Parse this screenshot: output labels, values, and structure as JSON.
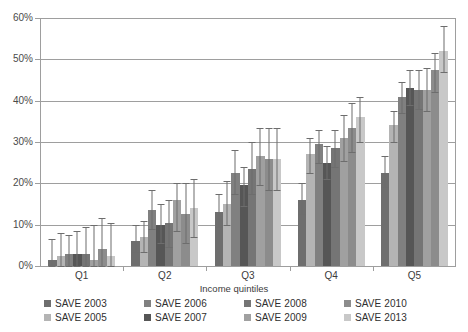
{
  "chart_data": {
    "type": "bar",
    "title": "",
    "subtitle": "",
    "xlabel": "Income quintiles",
    "ylabel": "",
    "categories": [
      "Q1",
      "Q2",
      "Q3",
      "Q4",
      "Q5"
    ],
    "ylim": [
      0,
      60
    ],
    "ytick_labels": [
      "0%",
      "10%",
      "20%",
      "30%",
      "40%",
      "50%",
      "60%"
    ],
    "ytick_values": [
      0,
      10,
      20,
      30,
      40,
      50,
      60
    ],
    "grid": true,
    "legend_position": "bottom",
    "value_unit": "percent",
    "error_bars": true,
    "series": [
      {
        "name": "SAVE 2003",
        "color": "#6e6e6e",
        "values": [
          1.5,
          6.0,
          13.0,
          16.0,
          22.5
        ],
        "err_low": [
          1.5,
          2.5,
          3.5,
          3.5,
          3.5
        ],
        "err_high": [
          5.0,
          4.0,
          4.5,
          4.0,
          4.0
        ]
      },
      {
        "name": "SAVE 2005",
        "color": "#b4b4b4",
        "values": [
          2.5,
          7.0,
          15.0,
          27.0,
          34.0
        ],
        "err_low": [
          2.5,
          3.5,
          5.0,
          4.5,
          4.0
        ],
        "err_high": [
          5.5,
          4.0,
          5.5,
          4.0,
          3.5
        ]
      },
      {
        "name": "SAVE 2006",
        "color": "#808080",
        "values": [
          3.0,
          13.5,
          22.5,
          29.5,
          41.0
        ],
        "err_low": [
          3.0,
          4.5,
          5.0,
          4.5,
          4.0
        ],
        "err_high": [
          4.5,
          5.0,
          5.5,
          3.5,
          3.5
        ]
      },
      {
        "name": "SAVE 2007",
        "color": "#565656",
        "values": [
          3.0,
          10.0,
          19.5,
          25.0,
          43.0
        ],
        "err_low": [
          3.0,
          4.5,
          5.0,
          4.0,
          4.0
        ],
        "err_high": [
          5.5,
          5.0,
          4.5,
          4.0,
          4.5
        ]
      },
      {
        "name": "SAVE 2008",
        "color": "#757575",
        "values": [
          3.0,
          10.5,
          23.5,
          28.5,
          42.5
        ],
        "err_low": [
          3.0,
          6.0,
          6.0,
          4.5,
          4.5
        ],
        "err_high": [
          6.5,
          5.5,
          6.5,
          4.5,
          5.0
        ]
      },
      {
        "name": "SAVE 2009",
        "color": "#a0a0a0",
        "values": [
          1.5,
          16.0,
          26.5,
          31.0,
          42.5
        ],
        "err_low": [
          1.5,
          7.5,
          7.0,
          5.5,
          5.0
        ],
        "err_high": [
          8.5,
          4.0,
          7.0,
          5.5,
          5.5
        ]
      },
      {
        "name": "SAVE 2010",
        "color": "#8c8c8c",
        "values": [
          4.0,
          12.5,
          26.0,
          33.5,
          47.5
        ],
        "err_low": [
          4.0,
          7.0,
          7.5,
          6.0,
          5.5
        ],
        "err_high": [
          7.5,
          7.5,
          7.5,
          6.0,
          4.0
        ]
      },
      {
        "name": "SAVE 2013",
        "color": "#c8c8c8",
        "values": [
          2.5,
          14.0,
          26.0,
          36.0,
          52.0
        ],
        "err_low": [
          2.5,
          7.0,
          7.5,
          6.0,
          5.0
        ],
        "err_high": [
          8.0,
          7.0,
          7.5,
          5.0,
          6.0
        ]
      }
    ]
  }
}
